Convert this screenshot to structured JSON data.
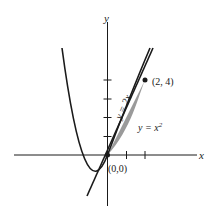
{
  "diagram": {
    "axes": {
      "x_label": "x",
      "y_label": "y",
      "x_ticks": [
        1,
        2
      ],
      "y_ticks": [
        1,
        2,
        3,
        4
      ]
    },
    "curves": [
      {
        "name": "parabola",
        "equation_prefix": "y = x",
        "equation_exp": "2"
      },
      {
        "name": "line",
        "equation": "y = 2x"
      }
    ],
    "points": [
      {
        "label": "(0,0)",
        "x": 0,
        "y": 0
      },
      {
        "label": "(2, 4)",
        "x": 2,
        "y": 4
      }
    ],
    "shaded_region": "area between y = 2x and y = x^2 for 0 ≤ x ≤ 2",
    "colors": {
      "stroke": "#1a1a1a",
      "shade": "#9a9a9a"
    }
  }
}
